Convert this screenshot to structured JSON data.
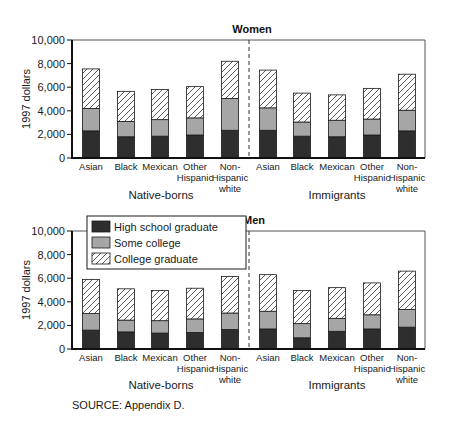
{
  "chart_data": [
    {
      "type": "bar",
      "stacked": true,
      "title": "Women",
      "ylabel": "1997 dollars",
      "xlabel": "",
      "ylim": [
        0,
        10000
      ],
      "yticks": [
        0,
        2000,
        4000,
        6000,
        8000,
        10000
      ],
      "ytick_labels": [
        "0",
        "2,000",
        "4,000",
        "6,000",
        "8,000",
        "10,000"
      ],
      "groups": [
        "Native-borns",
        "Immigrants"
      ],
      "categories": [
        "Asian",
        "Black",
        "Mexican",
        "Other Hispanic",
        "Non-Hispanic white",
        "Asian",
        "Black",
        "Mexican",
        "Other Hispanic",
        "Non-Hispanic white"
      ],
      "category_lines": [
        [
          "Asian"
        ],
        [
          "Black"
        ],
        [
          "Mexican"
        ],
        [
          "Other",
          "Hispanic"
        ],
        [
          "Non-",
          "Hispanic",
          "white"
        ],
        [
          "Asian"
        ],
        [
          "Black"
        ],
        [
          "Mexican"
        ],
        [
          "Other",
          "Hispanic"
        ],
        [
          "Non-",
          "Hispanic",
          "white"
        ]
      ],
      "series": [
        {
          "name": "High school graduate",
          "values": [
            2300,
            1800,
            1850,
            1950,
            2350,
            2350,
            1850,
            1800,
            1950,
            2300
          ]
        },
        {
          "name": "Some college",
          "values": [
            1900,
            1300,
            1400,
            1450,
            2700,
            1900,
            1200,
            1400,
            1350,
            1750
          ]
        },
        {
          "name": "College graduate",
          "values": [
            3350,
            2550,
            2550,
            2650,
            3150,
            3200,
            2450,
            2150,
            2600,
            3050
          ]
        }
      ],
      "grid": false
    },
    {
      "type": "bar",
      "stacked": true,
      "title": "Men",
      "ylabel": "1997 dollars",
      "xlabel": "",
      "ylim": [
        0,
        10000
      ],
      "yticks": [
        0,
        2000,
        4000,
        6000,
        8000,
        10000
      ],
      "ytick_labels": [
        "0",
        "2,000",
        "4,000",
        "6,000",
        "8,000",
        "10,000"
      ],
      "groups": [
        "Native-borns",
        "Immigrants"
      ],
      "categories": [
        "Asian",
        "Black",
        "Mexican",
        "Other Hispanic",
        "Non-Hispanic white",
        "Asian",
        "Black",
        "Mexican",
        "Other Hispanic",
        "Non-Hispanic white"
      ],
      "category_lines": [
        [
          "Asian"
        ],
        [
          "Black"
        ],
        [
          "Mexican"
        ],
        [
          "Other",
          "Hispanic"
        ],
        [
          "Non-",
          "Hispanic",
          "white"
        ],
        [
          "Asian"
        ],
        [
          "Black"
        ],
        [
          "Mexican"
        ],
        [
          "Other",
          "Hispanic"
        ],
        [
          "Non-",
          "Hispanic",
          "white"
        ]
      ],
      "series": [
        {
          "name": "High school graduate",
          "values": [
            1600,
            1450,
            1350,
            1400,
            1650,
            1700,
            950,
            1500,
            1700,
            1850
          ]
        },
        {
          "name": "Some college",
          "values": [
            1400,
            1000,
            1050,
            1150,
            1400,
            1500,
            1200,
            1100,
            1200,
            1500
          ]
        },
        {
          "name": "College graduate",
          "values": [
            2900,
            2650,
            2550,
            2600,
            3100,
            3100,
            2800,
            2600,
            2700,
            3250
          ]
        }
      ],
      "grid": false,
      "legend": {
        "placement": "top-left",
        "entries": [
          {
            "label": "High school graduate",
            "fill": "#2e2e2e",
            "pattern": "solid"
          },
          {
            "label": "Some college",
            "fill": "#a6a6a6",
            "pattern": "solid"
          },
          {
            "label": "College graduate",
            "fill": "#ffffff",
            "pattern": "hatch"
          }
        ]
      }
    }
  ],
  "colors": {
    "high_school": "#2e2e2e",
    "some_college": "#a6a6a6",
    "college": "#ffffff",
    "axis": "#1a1a1a"
  },
  "source_note": "SOURCE:  Appendix D."
}
